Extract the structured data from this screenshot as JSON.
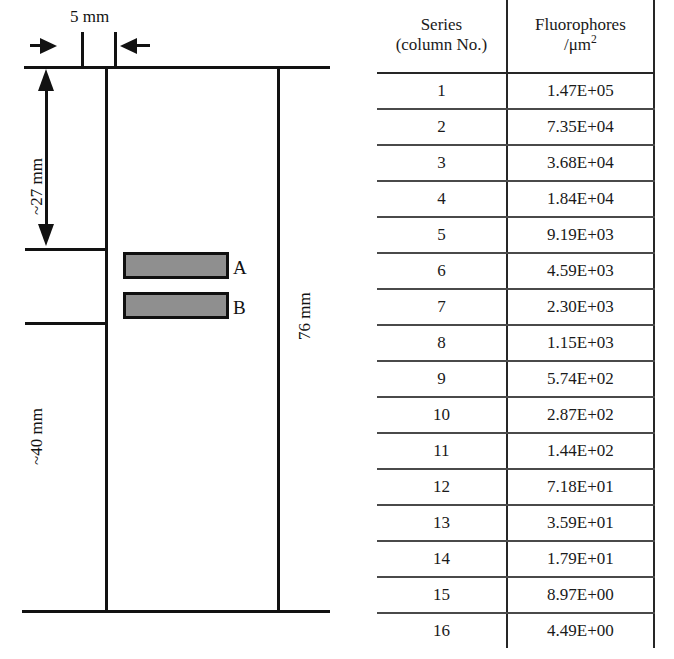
{
  "schematic": {
    "name": "microarray-slide-schematic",
    "dimensions": {
      "top_width": "5 mm",
      "upper_margin": "~27 mm",
      "lower_margin": "~40 mm",
      "slide_length": "76 mm"
    },
    "patches": [
      {
        "label": "A"
      },
      {
        "label": "B"
      }
    ],
    "colors": {
      "line": "#121212",
      "patch_fill": "#8f8f8f",
      "patch_border": "#101010"
    }
  },
  "table": {
    "name": "fluorophore-density-table",
    "headers": {
      "series_line1": "Series",
      "series_line2": "(column No.)",
      "density_line1": "Fluorophores",
      "density_line2_prefix": "/μm",
      "density_line2_exponent": "2"
    },
    "rows": [
      {
        "series": "1",
        "density": "1.47E+05"
      },
      {
        "series": "2",
        "density": "7.35E+04"
      },
      {
        "series": "3",
        "density": "3.68E+04"
      },
      {
        "series": "4",
        "density": "1.84E+04"
      },
      {
        "series": "5",
        "density": "9.19E+03"
      },
      {
        "series": "6",
        "density": "4.59E+03"
      },
      {
        "series": "7",
        "density": "2.30E+03"
      },
      {
        "series": "8",
        "density": "1.15E+03"
      },
      {
        "series": "9",
        "density": "5.74E+02"
      },
      {
        "series": "10",
        "density": "2.87E+02"
      },
      {
        "series": "11",
        "density": "1.44E+02"
      },
      {
        "series": "12",
        "density": "7.18E+01"
      },
      {
        "series": "13",
        "density": "3.59E+01"
      },
      {
        "series": "14",
        "density": "1.79E+01"
      },
      {
        "series": "15",
        "density": "8.97E+00"
      },
      {
        "series": "16",
        "density": "4.49E+00"
      }
    ]
  }
}
